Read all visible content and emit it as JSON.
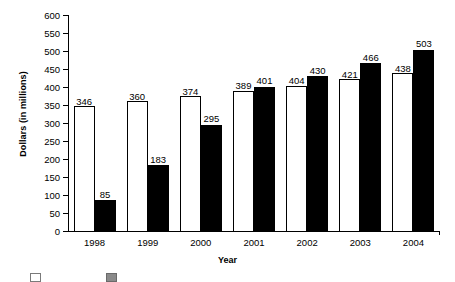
{
  "chart_data": {
    "type": "bar",
    "title": "",
    "xlabel": "Year",
    "ylabel": "Dollars (in millions)",
    "categories": [
      "1998",
      "1999",
      "2000",
      "2001",
      "2002",
      "2003",
      "2004"
    ],
    "series": [
      {
        "name": "series-1-light",
        "style": "white bar with black outline",
        "values": [
          346,
          360,
          374,
          389,
          404,
          421,
          438
        ]
      },
      {
        "name": "series-2-dark",
        "style": "solid black bar",
        "values": [
          85,
          183,
          295,
          401,
          430,
          466,
          503
        ]
      }
    ],
    "ylim": [
      0,
      600
    ],
    "yticks": [
      0,
      50,
      100,
      150,
      200,
      250,
      300,
      350,
      400,
      450,
      500,
      550,
      600
    ],
    "ytick_labels": [
      "0",
      "50",
      "100",
      "150",
      "200",
      "250",
      "300",
      "350",
      "400",
      "450",
      "500",
      "550",
      "600"
    ],
    "grid": false,
    "legend_position": "bottom",
    "data_labels": true,
    "colors": {
      "series_1": "#ffffff",
      "series_1_outline": "#000000",
      "series_2": "#000000",
      "axis": "#000000",
      "text": "#000000"
    }
  },
  "legend": {
    "items": [
      {
        "label": "",
        "swatch": "light-swatch"
      },
      {
        "label": "",
        "swatch": "dark-swatch"
      }
    ],
    "note_cropped": "legend row is cut off at the bottom edge of the screenshot"
  }
}
